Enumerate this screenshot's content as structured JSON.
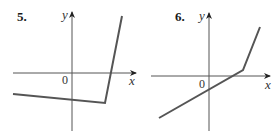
{
  "figures": [
    {
      "number": "5.",
      "y_label": "y",
      "x_label": "x",
      "origin_label": "0",
      "graph": {
        "description": "piecewise linear: gently decreasing line below x-axis, then steep rise crossing the x-axis",
        "points": [
          [
            13,
            94
          ],
          [
            105,
            103
          ],
          [
            122,
            16
          ]
        ]
      }
    },
    {
      "number": "6.",
      "y_label": "y",
      "x_label": "x",
      "origin_label": "0",
      "graph": {
        "description": "piecewise linear: rising line through negative y-intercept, kink above x-axis, then steeper rise",
        "points": [
          [
            159,
            118
          ],
          [
            243,
            70
          ],
          [
            260,
            27
          ]
        ]
      }
    }
  ],
  "colors": {
    "axis": "#444444",
    "curve": "#555555",
    "text": "#1a1a1a"
  }
}
